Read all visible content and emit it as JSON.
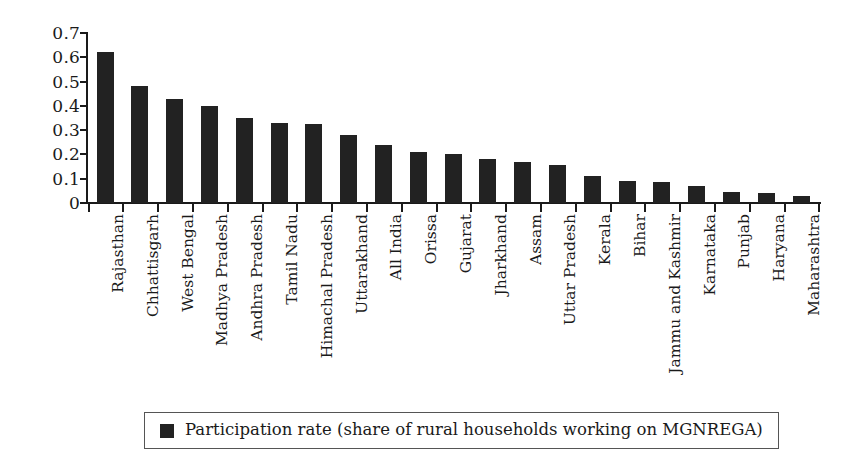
{
  "chart_data": {
    "type": "bar",
    "title": "",
    "subtitle": "",
    "xlabel": "",
    "ylabel": "",
    "ylim": [
      0,
      0.7
    ],
    "grid": false,
    "legend_position": "bottom",
    "bar_color": "#222222",
    "axis_color": "#1a1a1a",
    "background": "#ffffff",
    "yticks": [
      "0",
      "0.1",
      "0.2",
      "0.3",
      "0.4",
      "0.5",
      "0.6",
      "0.7"
    ],
    "ytick_values": [
      0,
      0.1,
      0.2,
      0.3,
      0.4,
      0.5,
      0.6,
      0.7
    ],
    "categories": [
      "Rajasthan",
      "Chhattisgarh",
      "West Bengal",
      "Madhya Pradesh",
      "Andhra Pradesh",
      "Tamil Nadu",
      "Himachal Pradesh",
      "Uttarakhand",
      "All India",
      "Orissa",
      "Gujarat",
      "Jharkhand",
      "Assam",
      "Uttar Pradesh",
      "Kerala",
      "Bihar",
      "Jammu and Kashmir",
      "Karnataka",
      "Punjab",
      "Haryana",
      "Maharashtra"
    ],
    "values": [
      0.62,
      0.48,
      0.43,
      0.4,
      0.35,
      0.33,
      0.325,
      0.28,
      0.24,
      0.21,
      0.2,
      0.18,
      0.17,
      0.155,
      0.11,
      0.09,
      0.085,
      0.07,
      0.045,
      0.04,
      0.03
    ],
    "series": [
      {
        "name": "Participation rate (share of rural households working on MGNREGA)",
        "values": [
          0.62,
          0.48,
          0.43,
          0.4,
          0.35,
          0.33,
          0.325,
          0.28,
          0.24,
          0.21,
          0.2,
          0.18,
          0.17,
          0.155,
          0.11,
          0.09,
          0.085,
          0.07,
          0.045,
          0.04,
          0.03
        ]
      }
    ]
  },
  "legend": {
    "label": "Participation rate (share of rural households working on MGNREGA)",
    "swatch_color": "#222222"
  }
}
